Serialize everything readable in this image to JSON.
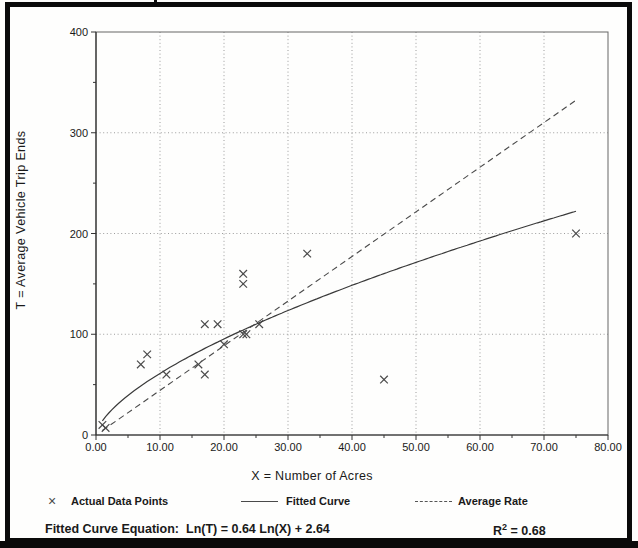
{
  "chart_data": {
    "type": "scatter",
    "title": "",
    "xlabel": "X = Number of Acres",
    "ylabel": "T = Average Vehicle Trip Ends",
    "xlim": [
      0,
      80
    ],
    "ylim": [
      0,
      400
    ],
    "x_ticks": [
      0,
      10,
      20,
      30,
      40,
      50,
      60,
      70,
      80
    ],
    "x_tick_labels": [
      "0.00",
      "10.00",
      "20.00",
      "30.00",
      "40.00",
      "50.00",
      "60.00",
      "70.00",
      "80.00"
    ],
    "x_minor_ticks": [
      5,
      15,
      25,
      35,
      45,
      55,
      65,
      75
    ],
    "y_ticks": [
      0,
      100,
      200,
      300,
      400
    ],
    "y_tick_labels": [
      "0",
      "100",
      "200",
      "300",
      "400"
    ],
    "y_minor_ticks": [
      50,
      150,
      250,
      350
    ],
    "grid_x": [
      10,
      20,
      30,
      40,
      50,
      60,
      70
    ],
    "grid_y": [
      100,
      200,
      300
    ],
    "grid_on": true,
    "legend_position": "bottom",
    "series": [
      {
        "name": "Actual Data Points",
        "type": "scatter",
        "marker": "x",
        "points": [
          [
            1,
            10
          ],
          [
            1.5,
            7
          ],
          [
            7,
            70
          ],
          [
            8,
            80
          ],
          [
            11,
            60
          ],
          [
            16,
            70
          ],
          [
            17,
            60
          ],
          [
            17,
            110
          ],
          [
            19,
            110
          ],
          [
            20,
            90
          ],
          [
            23,
            100
          ],
          [
            23.5,
            100
          ],
          [
            25.5,
            110
          ],
          [
            23,
            150
          ],
          [
            23,
            160
          ],
          [
            33,
            180
          ],
          [
            45,
            55
          ],
          [
            75,
            200
          ]
        ]
      },
      {
        "name": "Fitted Curve",
        "type": "line",
        "style": "solid",
        "model": "ln-ln",
        "intercept": 2.64,
        "slope": 0.64,
        "x_start": 1,
        "x_end": 75
      },
      {
        "name": "Average Rate",
        "type": "line",
        "style": "dashed",
        "rate": 4.43,
        "x_start": 1,
        "x_end": 75
      }
    ],
    "colors": {
      "marker": "#4a4a4a",
      "fitted": "#3a3a3a",
      "rate": "#4a4a4a",
      "grid": "#9c9c9c",
      "axis": "#333333",
      "border": "#666666"
    }
  },
  "legend": {
    "items": [
      {
        "marker_glyph": "×",
        "label": "Actual Data Points"
      },
      {
        "marker_glyph": "",
        "label": "Fitted Curve"
      },
      {
        "marker_glyph": "",
        "label": "Average Rate"
      }
    ]
  },
  "footer": {
    "equation_label": "Fitted Curve Equation:",
    "equation": "Ln(T) = 0.64 Ln(X) + 2.64",
    "r_squared_base": "R",
    "r_squared_sup": "2",
    "r_squared_rest": " = 0.68"
  }
}
